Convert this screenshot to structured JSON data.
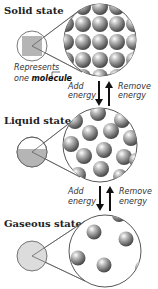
{
  "diagram": {
    "states": [
      {
        "title": "Solid state",
        "icon": "solid-square"
      },
      {
        "title": "Liquid state",
        "icon": "half-filled-circle"
      },
      {
        "title": "Gaseous state",
        "icon": "light-filled-circle"
      }
    ],
    "callout": {
      "line1": "Represents",
      "line2_prefix": "one ",
      "line2_bold": "molecule"
    },
    "transitions": [
      {
        "left": {
          "line1": "Add",
          "line2": "energy",
          "direction": "down"
        },
        "right": {
          "line1": "Remove",
          "line2": "energy",
          "direction": "up"
        }
      },
      {
        "left": {
          "line1": "Add",
          "line2": "energy",
          "direction": "down"
        },
        "right": {
          "line1": "Remove",
          "line2": "energy",
          "direction": "up"
        }
      }
    ],
    "colors": {
      "fill_gray": "#b5b5b5",
      "gas_fill": "#dcdcdc",
      "outline": "#555555",
      "arrow": "#111111"
    }
  }
}
